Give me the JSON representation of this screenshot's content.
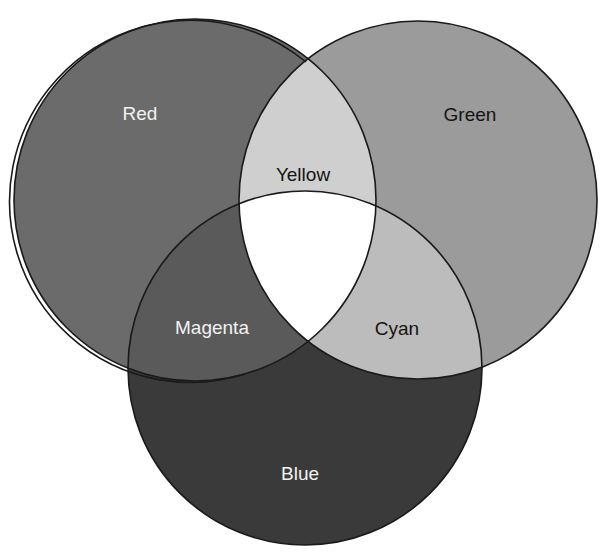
{
  "diagram": {
    "type": "venn",
    "title": "",
    "circles": [
      {
        "id": "red",
        "label": "Red",
        "cx": 195,
        "cy": 200,
        "r": 181,
        "fill": "#6b6b6b",
        "text_color": "#f2f2f2"
      },
      {
        "id": "green",
        "label": "Green",
        "cx": 418,
        "cy": 200,
        "r": 179,
        "fill": "#9b9b9b",
        "text_color": "#141414"
      },
      {
        "id": "blue",
        "label": "Blue",
        "cx": 305,
        "cy": 368,
        "r": 177,
        "fill": "#3a3a3a",
        "text_color": "#f2f2f2"
      }
    ],
    "overlaps": [
      {
        "id": "yellow",
        "label": "Yellow",
        "sets": [
          "red",
          "green"
        ],
        "fill": "#cfcfcf",
        "text_color": "#141414"
      },
      {
        "id": "magenta",
        "label": "Magenta",
        "sets": [
          "red",
          "blue"
        ],
        "fill": "#5a5a5a",
        "text_color": "#f2f2f2"
      },
      {
        "id": "cyan",
        "label": "Cyan",
        "sets": [
          "green",
          "blue"
        ],
        "fill": "#bcbcbc",
        "text_color": "#141414"
      },
      {
        "id": "white",
        "label": "",
        "sets": [
          "red",
          "green",
          "blue"
        ],
        "fill": "#ffffff"
      }
    ],
    "labels": {
      "red": {
        "text": "Red",
        "x": 140,
        "y": 120
      },
      "green": {
        "text": "Green",
        "x": 470,
        "y": 121
      },
      "blue": {
        "text": "Blue",
        "x": 300,
        "y": 480
      },
      "yellow": {
        "text": "Yellow",
        "x": 303,
        "y": 181
      },
      "magenta": {
        "text": "Magenta",
        "x": 212,
        "y": 334
      },
      "cyan": {
        "text": "Cyan",
        "x": 397,
        "y": 335
      }
    },
    "outline_color": "#1a1a1a"
  }
}
